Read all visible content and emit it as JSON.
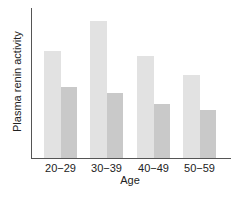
{
  "chart_data": {
    "type": "bar",
    "title": "",
    "xlabel": "Age",
    "ylabel": "Plasma renin activity",
    "categories": [
      "20−29",
      "30−39",
      "40−49",
      "50−59"
    ],
    "series": [
      {
        "name": "Series A (light)",
        "color": "#e2e2e2",
        "values": [
          107,
          137,
          102,
          83
        ]
      },
      {
        "name": "Series B (dark)",
        "color": "#c9c9c9",
        "values": [
          71,
          65,
          54,
          48
        ]
      }
    ],
    "ylim": [
      0,
      150
    ],
    "y_ticks_shown": false,
    "grid": false,
    "legend": "none"
  }
}
